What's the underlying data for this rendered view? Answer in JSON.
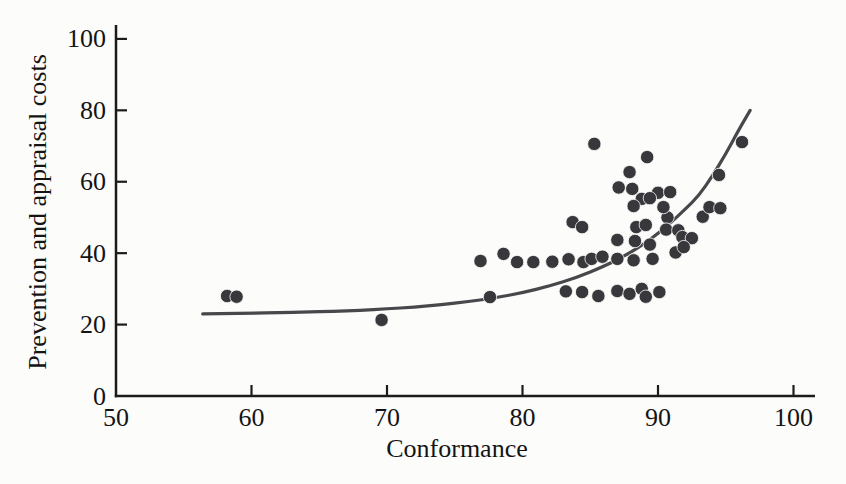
{
  "figure": {
    "background": "#fcfcfb",
    "axis_color": "#1b1b1b",
    "text_color": "#141414",
    "dot_color": "#38383c",
    "curve_color": "#48484c"
  },
  "chart_data": {
    "type": "scatter",
    "title": "",
    "xlabel": "Conformance",
    "ylabel": "Prevention and appraisal costs",
    "xlim": [
      50,
      100
    ],
    "ylim": [
      0,
      100
    ],
    "x_ticks": [
      50,
      60,
      70,
      80,
      90,
      100
    ],
    "y_ticks": [
      0,
      20,
      40,
      60,
      80,
      100
    ],
    "grid": false,
    "legend": "none",
    "points": [
      [
        58.2,
        28.0
      ],
      [
        58.9,
        27.8
      ],
      [
        69.6,
        21.3
      ],
      [
        77.6,
        27.7
      ],
      [
        76.9,
        37.8
      ],
      [
        78.6,
        39.8
      ],
      [
        79.6,
        37.5
      ],
      [
        80.8,
        37.5
      ],
      [
        82.2,
        37.6
      ],
      [
        83.4,
        38.3
      ],
      [
        84.5,
        37.5
      ],
      [
        85.1,
        38.4
      ],
      [
        85.9,
        39.0
      ],
      [
        87.0,
        38.4
      ],
      [
        88.2,
        38.0
      ],
      [
        89.6,
        38.4
      ],
      [
        83.2,
        29.3
      ],
      [
        84.4,
        29.1
      ],
      [
        85.6,
        28.0
      ],
      [
        87.0,
        29.4
      ],
      [
        87.9,
        28.6
      ],
      [
        88.8,
        30.0
      ],
      [
        89.1,
        27.8
      ],
      [
        90.1,
        29.1
      ],
      [
        83.7,
        48.7
      ],
      [
        84.4,
        47.3
      ],
      [
        87.0,
        43.7
      ],
      [
        88.3,
        43.4
      ],
      [
        89.4,
        42.4
      ],
      [
        88.4,
        47.3
      ],
      [
        89.1,
        47.9
      ],
      [
        90.7,
        50.0
      ],
      [
        90.6,
        46.6
      ],
      [
        91.5,
        46.4
      ],
      [
        91.8,
        44.5
      ],
      [
        92.5,
        44.2
      ],
      [
        91.3,
        40.2
      ],
      [
        91.9,
        41.7
      ],
      [
        93.3,
        50.2
      ],
      [
        93.8,
        52.9
      ],
      [
        94.6,
        52.6
      ],
      [
        85.3,
        70.6
      ],
      [
        89.2,
        66.9
      ],
      [
        87.9,
        62.7
      ],
      [
        87.1,
        58.4
      ],
      [
        88.1,
        58.0
      ],
      [
        90.0,
        56.9
      ],
      [
        90.9,
        57.1
      ],
      [
        88.8,
        55.2
      ],
      [
        89.4,
        55.4
      ],
      [
        88.2,
        53.2
      ],
      [
        90.4,
        52.9
      ],
      [
        94.5,
        61.9
      ],
      [
        96.2,
        71.1
      ]
    ],
    "trend_line": [
      [
        56.4,
        23.0
      ],
      [
        58,
        23.1
      ],
      [
        60,
        23.2
      ],
      [
        62,
        23.3
      ],
      [
        64,
        23.5
      ],
      [
        66,
        23.7
      ],
      [
        68,
        24.0
      ],
      [
        70,
        24.4
      ],
      [
        72,
        24.9
      ],
      [
        74,
        25.6
      ],
      [
        76,
        26.4
      ],
      [
        78,
        27.5
      ],
      [
        80,
        28.9
      ],
      [
        82,
        30.8
      ],
      [
        84,
        33.2
      ],
      [
        86,
        36.3
      ],
      [
        87,
        38.2
      ],
      [
        88,
        40.3
      ],
      [
        89,
        42.7
      ],
      [
        90,
        45.5
      ],
      [
        91,
        48.7
      ],
      [
        92,
        52.3
      ],
      [
        93,
        56.0
      ],
      [
        94,
        61.5
      ],
      [
        95,
        67.8
      ],
      [
        96,
        74.8
      ],
      [
        96.8,
        80.0
      ]
    ]
  }
}
